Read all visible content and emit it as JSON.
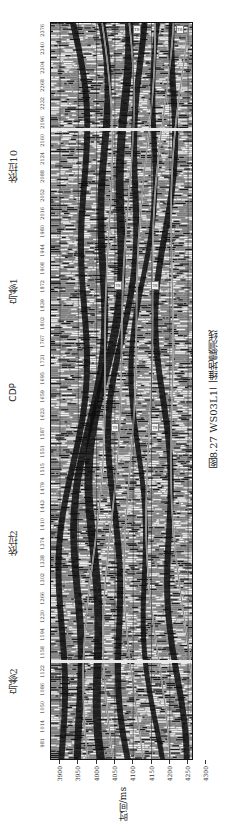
{
  "figure": {
    "caption": "图8.27   WS03L1二维地震测线",
    "orientation": "rotated 90° counter-clockwise (page landscape)"
  },
  "axes": {
    "cdp_label": "CDP",
    "cdp_ticks": [
      "981",
      "1014",
      "1050",
      "1086",
      "1122",
      "1158",
      "1194",
      "1230",
      "1266",
      "1302",
      "1338",
      "1374",
      "1410",
      "1443",
      "1479",
      "1515",
      "1551",
      "1587",
      "1623",
      "1659",
      "1695",
      "1731",
      "1767",
      "1803",
      "1839",
      "1872",
      "1908",
      "1944",
      "1980",
      "2016",
      "2052",
      "2088",
      "2124",
      "2160",
      "2196",
      "2232",
      "2268",
      "2304",
      "2340",
      "2376"
    ],
    "time_label": "时间/ms",
    "time_ticks": [
      "3900",
      "3950",
      "4000",
      "4050",
      "4100",
      "4150",
      "4200",
      "4250",
      "4300"
    ]
  },
  "wells": [
    {
      "name": "依拉10"
    },
    {
      "name": "乌参1"
    },
    {
      "name": "依拉2"
    },
    {
      "name": "乌参2"
    }
  ],
  "horizon_tags": [
    "T8-1",
    "T8-2",
    "T8",
    "T8",
    "T8",
    "T8"
  ],
  "colors": {
    "background": "#ffffff",
    "seismic_gray": "#9a9a9a",
    "peak_black": "#111111",
    "trough_white": "#f0f0f0",
    "well_line": "#eaeaea"
  }
}
